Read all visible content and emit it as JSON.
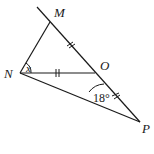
{
  "diagram": {
    "type": "geometry",
    "points": {
      "M": {
        "label": "M",
        "x": 50,
        "y": 22
      },
      "N": {
        "label": "N",
        "x": 20,
        "y": 73
      },
      "O": {
        "label": "O",
        "x": 95,
        "y": 73
      },
      "P": {
        "label": "P",
        "x": 140,
        "y": 122
      }
    },
    "segments": [
      "MN",
      "NO",
      "NP",
      "MP"
    ],
    "equal_marks": [
      "MO",
      "NO",
      "OP"
    ],
    "angles": {
      "MNO": {
        "label": "x"
      },
      "NPO_at_O": {
        "label": "18°"
      }
    },
    "stroke_color": "#1a1a1a",
    "background": "#ffffff"
  }
}
